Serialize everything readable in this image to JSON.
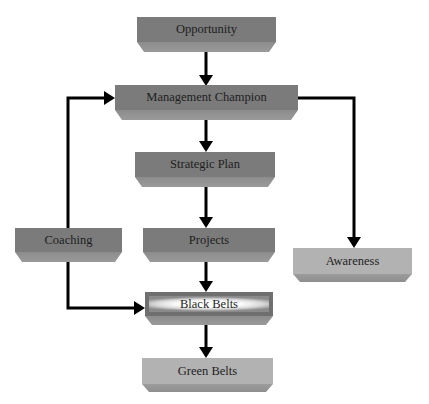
{
  "diagram": {
    "type": "flowchart",
    "nodes": {
      "opportunity": {
        "label": "Opportunity"
      },
      "management_champion": {
        "label": "Management Champion"
      },
      "strategic_plan": {
        "label": "Strategic Plan"
      },
      "projects": {
        "label": "Projects"
      },
      "coaching": {
        "label": "Coaching"
      },
      "black_belts": {
        "label": "Black Belts"
      },
      "green_belts": {
        "label": "Green Belts"
      },
      "awareness": {
        "label": "Awareness"
      }
    },
    "edges": [
      {
        "from": "Opportunity",
        "to": "Management Champion"
      },
      {
        "from": "Management Champion",
        "to": "Strategic Plan"
      },
      {
        "from": "Management Champion",
        "to": "Awareness"
      },
      {
        "from": "Strategic Plan",
        "to": "Projects"
      },
      {
        "from": "Projects",
        "to": "Black Belts"
      },
      {
        "from": "Coaching",
        "to": "Management Champion"
      },
      {
        "from": "Coaching",
        "to": "Black Belts"
      },
      {
        "from": "Black Belts",
        "to": "Green Belts"
      }
    ],
    "colors": {
      "dark_box": "#7b7b7b",
      "light_box": "#b2b2b2",
      "arrow": "#000000"
    }
  }
}
